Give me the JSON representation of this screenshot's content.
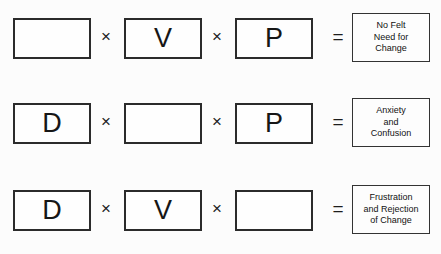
{
  "diagram": {
    "operator_times": "×",
    "operator_equals": "=",
    "background_color": "#fcfcfc",
    "border_color": "#2b2b2b",
    "text_color": "#161616",
    "rows": [
      {
        "id": "row-1",
        "factors": [
          {
            "label": "",
            "empty": true
          },
          {
            "label": "V",
            "empty": false
          },
          {
            "label": "P",
            "empty": false
          }
        ],
        "result": "No Felt\nNeed for\nChange"
      },
      {
        "id": "row-2",
        "factors": [
          {
            "label": "D",
            "empty": false
          },
          {
            "label": "",
            "empty": true
          },
          {
            "label": "P",
            "empty": false
          }
        ],
        "result": "Anxiety\nand\nConfusion"
      },
      {
        "id": "row-3",
        "factors": [
          {
            "label": "D",
            "empty": false
          },
          {
            "label": "V",
            "empty": false
          },
          {
            "label": "",
            "empty": true
          }
        ],
        "result": "Frustration\nand Rejection\nof Change"
      }
    ]
  }
}
